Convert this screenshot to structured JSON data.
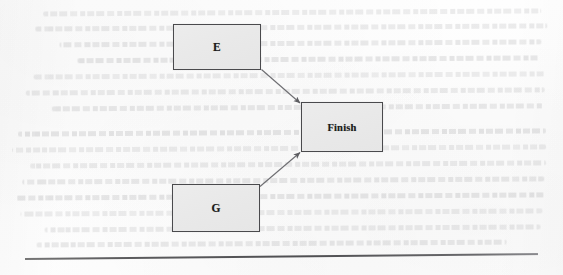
{
  "document": {
    "kind": "scanned-book-page-fragment",
    "figure_caption": "",
    "background_ghost_text_legible": false
  },
  "diagram": {
    "type": "flowchart",
    "title": "",
    "nodes": [
      {
        "id": "E",
        "label": "E",
        "shape": "rectangle",
        "x": 173,
        "y": 24,
        "w": 88,
        "h": 46
      },
      {
        "id": "Finish",
        "label": "Finish",
        "shape": "rectangle",
        "x": 301,
        "y": 102,
        "w": 82,
        "h": 50
      },
      {
        "id": "G",
        "label": "G",
        "shape": "rectangle",
        "x": 172,
        "y": 184,
        "w": 88,
        "h": 48
      }
    ],
    "edges": [
      {
        "from": "E",
        "to": "Finish",
        "label": "",
        "arrow": "end",
        "style": "solid"
      },
      {
        "from": "G",
        "to": "Finish",
        "label": "",
        "arrow": "end",
        "style": "solid"
      }
    ],
    "colors": {
      "node_fill": "#eaeaea",
      "node_border": "#4a4a4d",
      "label_text": "#1b1b1b",
      "edge_stroke": "#6e6e72",
      "rule_stroke": "#4f4f52",
      "page_background": "#fdfdfd"
    }
  },
  "footer": {
    "rule_visible": true
  },
  "ghost_text": {
    "note": "faint bleed-through from reverse side of page; not legible",
    "lines": [
      {
        "x": 44,
        "y": 10,
        "w": 498
      },
      {
        "x": 36,
        "y": 25,
        "w": 512
      },
      {
        "x": 60,
        "y": 41,
        "w": 482
      },
      {
        "x": 78,
        "y": 57,
        "w": 462
      },
      {
        "x": 34,
        "y": 73,
        "w": 512
      },
      {
        "x": 26,
        "y": 89,
        "w": 519
      },
      {
        "x": 52,
        "y": 105,
        "w": 492
      },
      {
        "x": 18,
        "y": 130,
        "w": 528
      },
      {
        "x": 12,
        "y": 146,
        "w": 534
      },
      {
        "x": 30,
        "y": 162,
        "w": 516
      },
      {
        "x": 22,
        "y": 178,
        "w": 522
      },
      {
        "x": 16,
        "y": 194,
        "w": 528
      },
      {
        "x": 20,
        "y": 210,
        "w": 522
      },
      {
        "x": 44,
        "y": 226,
        "w": 496
      },
      {
        "x": 36,
        "y": 241,
        "w": 470
      }
    ]
  }
}
